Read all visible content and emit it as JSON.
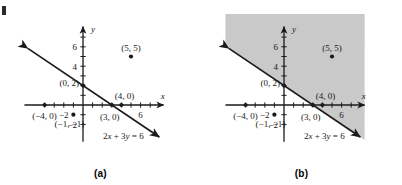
{
  "figure": {
    "kind": "math-graph-pair",
    "equation_label": "2x + 3y = 6",
    "colors": {
      "ink": "#1a1a1a",
      "shade": "#c9c9c9",
      "background": "#ffffff"
    }
  },
  "panels": [
    {
      "id": "a",
      "caption": "(a)",
      "shaded": false,
      "axis": {
        "x_label": "x",
        "y_label": "y",
        "x_ticks": [
          -4,
          -3,
          -2,
          -1,
          1,
          2,
          3,
          4,
          5,
          6,
          7
        ],
        "y_ticks": [
          -2,
          -1,
          1,
          2,
          3,
          4,
          5,
          6,
          7
        ],
        "x_tick_labels": [
          {
            "value": -2,
            "text": "-2"
          },
          {
            "value": 6,
            "text": "6"
          }
        ],
        "y_tick_labels": [
          {
            "value": 4,
            "text": "4"
          },
          {
            "value": 6,
            "text": "6"
          },
          {
            "value": -2,
            "text": "-2"
          }
        ],
        "xlim": [
          -6.1,
          8.4
        ],
        "ylim": [
          -3.8,
          8.1
        ]
      },
      "line": {
        "equation": "2x + 3y = 6",
        "slope": -0.6667,
        "intercept": 2,
        "arrows": "both"
      },
      "points": [
        {
          "x": 0,
          "y": 2,
          "label": "(0, 2)"
        },
        {
          "x": 3,
          "y": 0,
          "label": "(3, 0)"
        },
        {
          "x": 4,
          "y": 0,
          "label": "(4, 0)"
        },
        {
          "x": 5,
          "y": 5,
          "label": "(5, 5)"
        },
        {
          "x": -4,
          "y": 0,
          "label": "(-4, 0)"
        },
        {
          "x": -1,
          "y": -1,
          "label": "(-1, -1)"
        }
      ]
    },
    {
      "id": "b",
      "caption": "(b)",
      "shaded": true,
      "shade_side": "above-right",
      "axis": {
        "x_label": "x",
        "y_label": "y",
        "x_ticks": [
          -4,
          -3,
          -2,
          -1,
          1,
          2,
          3,
          4,
          5,
          6,
          7
        ],
        "y_ticks": [
          -2,
          -1,
          1,
          2,
          3,
          4,
          5,
          6,
          7
        ],
        "x_tick_labels": [
          {
            "value": -2,
            "text": "-2"
          },
          {
            "value": 6,
            "text": "6"
          }
        ],
        "y_tick_labels": [
          {
            "value": 4,
            "text": "4"
          },
          {
            "value": 6,
            "text": "6"
          },
          {
            "value": -2,
            "text": "-2"
          }
        ],
        "xlim": [
          -6.1,
          8.4
        ],
        "ylim": [
          -3.8,
          8.1
        ]
      },
      "line": {
        "equation": "2x + 3y = 6",
        "slope": -0.6667,
        "intercept": 2,
        "arrows": "both"
      },
      "points": [
        {
          "x": 0,
          "y": 2,
          "label": "(0, 2)"
        },
        {
          "x": 3,
          "y": 0,
          "label": "(3, 0)"
        },
        {
          "x": 4,
          "y": 0,
          "label": "(4, 0)"
        },
        {
          "x": 5,
          "y": 5,
          "label": "(5, 5)"
        },
        {
          "x": -4,
          "y": 0,
          "label": "(-4, 0)"
        },
        {
          "x": -1,
          "y": -1,
          "label": "(-1, -1)"
        }
      ]
    }
  ]
}
